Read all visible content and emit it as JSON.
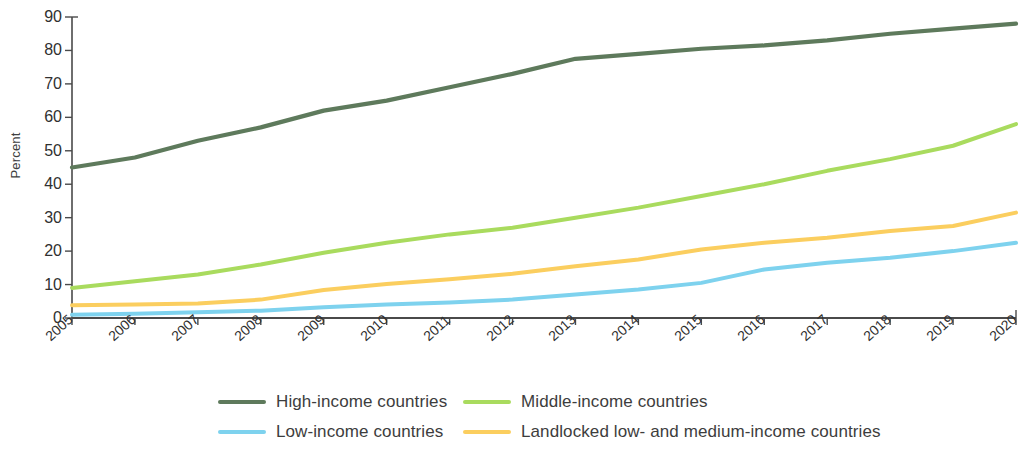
{
  "chart_data": {
    "type": "line",
    "title": "",
    "xlabel": "",
    "ylabel": "Percent",
    "x": [
      2005,
      2006,
      2007,
      2008,
      2009,
      2010,
      2011,
      2012,
      2013,
      2014,
      2015,
      2016,
      2017,
      2018,
      2019,
      2020
    ],
    "xtick_labels": [
      "2005",
      "2006",
      "2007",
      "2008",
      "2009",
      "2010",
      "2011",
      "2012",
      "2013",
      "2014",
      "2015",
      "2016",
      "2017",
      "2018",
      "2019",
      "2020"
    ],
    "ytick_labels": [
      "0",
      "10",
      "20",
      "30",
      "40",
      "50",
      "60",
      "70",
      "80",
      "90"
    ],
    "yticks": [
      0,
      10,
      20,
      30,
      40,
      50,
      60,
      70,
      80,
      90
    ],
    "ylim": [
      0,
      90
    ],
    "xlim": [
      2005,
      2020
    ],
    "grid": false,
    "legend_position": "bottom",
    "series": [
      {
        "name": "High-income countries",
        "color": "#5e7a5c",
        "values": [
          45,
          48,
          53,
          57,
          62,
          65,
          69,
          73,
          77.5,
          79,
          80.5,
          81.5,
          83,
          85,
          86.5,
          88
        ]
      },
      {
        "name": "Middle-income countries",
        "color": "#a9db5e",
        "values": [
          9,
          11,
          13,
          16,
          19.5,
          22.5,
          25,
          27,
          30,
          33,
          36.5,
          40,
          44,
          47.5,
          51.5,
          58
        ]
      },
      {
        "name": "Low-income countries",
        "color": "#7ed2ee",
        "values": [
          1,
          1.3,
          1.7,
          2.2,
          3.2,
          4,
          4.6,
          5.5,
          7,
          8.5,
          10.5,
          14.5,
          16.5,
          18,
          20,
          22.5
        ]
      },
      {
        "name": "Landlocked low- and medium-income countries",
        "color": "#fbce5f",
        "values": [
          3.8,
          4,
          4.3,
          5.5,
          8.4,
          10.2,
          11.6,
          13.2,
          15.5,
          17.5,
          20.5,
          22.5,
          24,
          26,
          27.5,
          31.5
        ]
      }
    ]
  },
  "legend": {
    "items": [
      {
        "label": "High-income countries",
        "color": "#5e7a5c"
      },
      {
        "label": "Middle-income countries",
        "color": "#a9db5e"
      },
      {
        "label": "Low-income countries",
        "color": "#7ed2ee"
      },
      {
        "label": "Landlocked low- and medium-income countries",
        "color": "#fbce5f"
      }
    ]
  }
}
